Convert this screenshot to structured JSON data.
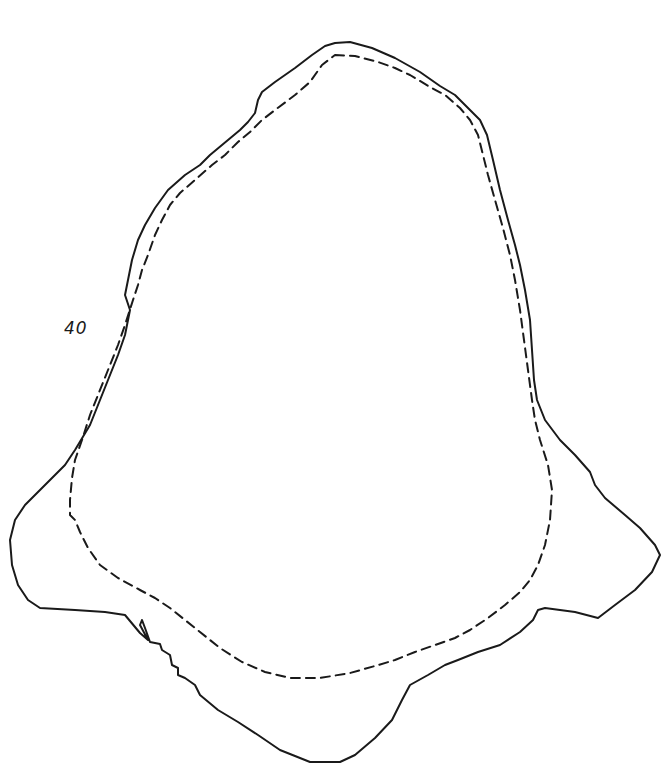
{
  "diagram": {
    "label": "40",
    "label_position": {
      "x": 64,
      "y": 318
    },
    "stroke_color": "#1a1a1a",
    "background": "#ffffff",
    "outlines": [
      {
        "name": "outer-outline",
        "style": "solid",
        "width": 2
      },
      {
        "name": "inner-outline",
        "style": "dashed",
        "width": 2,
        "dash": "9 6"
      }
    ]
  }
}
